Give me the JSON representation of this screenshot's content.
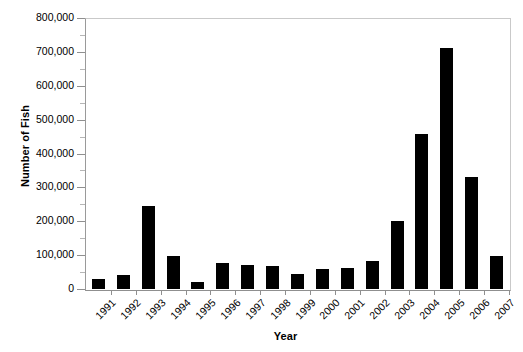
{
  "chart_data": {
    "type": "bar",
    "title": "",
    "xlabel": "Year",
    "ylabel": "Number of Fish",
    "categories": [
      "1991",
      "1992",
      "1993",
      "1994",
      "1995",
      "1996",
      "1997",
      "1998",
      "1999",
      "2000",
      "2001",
      "2002",
      "2003",
      "2004",
      "2005",
      "2006",
      "2007"
    ],
    "values": [
      30000,
      42000,
      245000,
      96000,
      20000,
      78000,
      70000,
      68000,
      45000,
      60000,
      63000,
      82000,
      200000,
      458000,
      710000,
      330000,
      97000
    ],
    "ylim": [
      0,
      800000
    ],
    "ytick_values": [
      0,
      100000,
      200000,
      300000,
      400000,
      500000,
      600000,
      700000,
      800000
    ],
    "ytick_labels": [
      "0",
      "100,000",
      "200,000",
      "300,000",
      "400,000",
      "500,000",
      "600,000",
      "700,000",
      "800,000"
    ],
    "grid": false,
    "legend": null,
    "bar_color": "#000000",
    "axis_color": "#8f8f8f",
    "frame_color": "#c9c9c9"
  }
}
